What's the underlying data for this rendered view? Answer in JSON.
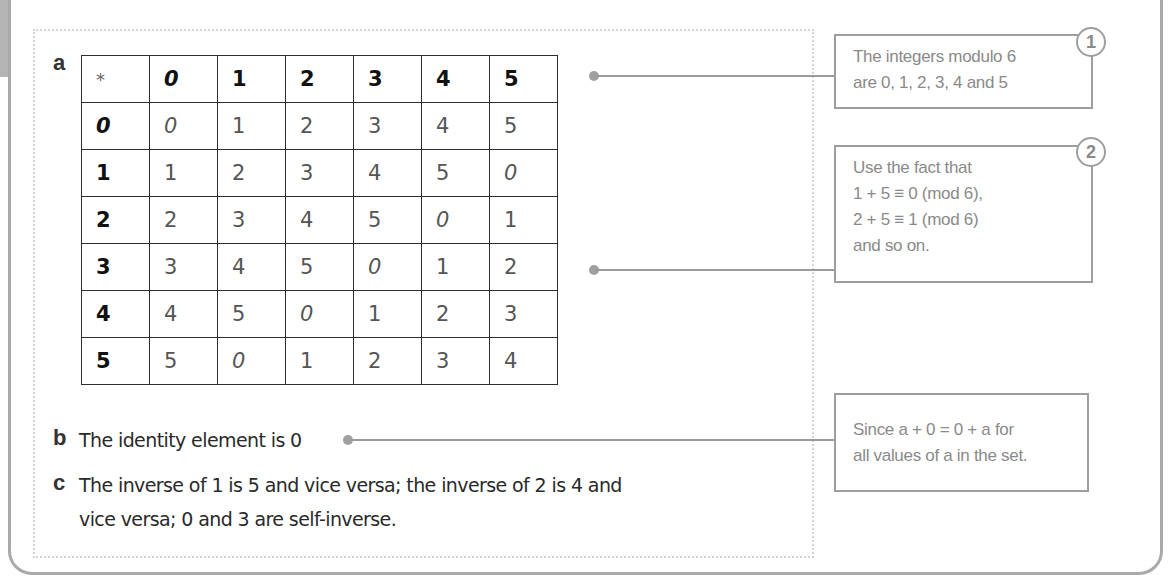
{
  "parts": {
    "a": {
      "letter": "a"
    },
    "b": {
      "letter": "b",
      "text": "The identity element is 0"
    },
    "c": {
      "letter": "c",
      "line1": "The inverse of 1 is 5 and vice versa; the inverse of 2 is 4 and",
      "line2": "vice versa; 0 and 3 are self-inverse."
    }
  },
  "table": {
    "operator": "*",
    "column_headers": [
      "0",
      "1",
      "2",
      "3",
      "4",
      "5"
    ],
    "rows": [
      {
        "header": "0",
        "cells": [
          "0",
          "1",
          "2",
          "3",
          "4",
          "5"
        ]
      },
      {
        "header": "1",
        "cells": [
          "1",
          "2",
          "3",
          "4",
          "5",
          "0"
        ]
      },
      {
        "header": "2",
        "cells": [
          "2",
          "3",
          "4",
          "5",
          "0",
          "1"
        ]
      },
      {
        "header": "3",
        "cells": [
          "3",
          "4",
          "5",
          "0",
          "1",
          "2"
        ]
      },
      {
        "header": "4",
        "cells": [
          "4",
          "5",
          "0",
          "1",
          "2",
          "3"
        ]
      },
      {
        "header": "5",
        "cells": [
          "5",
          "0",
          "1",
          "2",
          "3",
          "4"
        ]
      }
    ]
  },
  "notes": [
    {
      "number": "1",
      "lines": [
        "The integers modulo 6",
        "are 0, 1, 2, 3, 4 and 5"
      ]
    },
    {
      "number": "2",
      "lines": [
        "Use the fact that",
        "1 + 5 ≡ 0  (mod 6),",
        "2 + 5 ≡ 1 (mod 6)",
        "and so on."
      ]
    },
    {
      "number": "",
      "lines": [
        "Since a + 0 = 0 + a for",
        "all values of a in the set."
      ]
    }
  ],
  "colors": {
    "frame": "#a9a9a9",
    "note_text": "#8a8a8a",
    "table_border": "#2e2e2e",
    "connector": "#9b9b9b"
  }
}
